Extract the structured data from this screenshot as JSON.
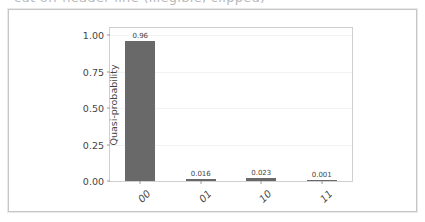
{
  "top_cropped_text": {
    "text": "cut off header line (illegible, clipped)"
  },
  "figure": {
    "alt": "quasi-probability bar chart"
  },
  "chart_data": {
    "type": "bar",
    "title": "",
    "xlabel": "",
    "ylabel": "Quasi-probability",
    "categories": [
      "00",
      "01",
      "10",
      "11"
    ],
    "values": [
      0.96,
      0.016,
      0.023,
      0.001
    ],
    "value_labels": [
      "0.96",
      "0.016",
      "0.023",
      "0.001"
    ],
    "ylim": [
      0.0,
      1.05
    ],
    "yticks": [
      0.0,
      0.25,
      0.5,
      0.75,
      1.0
    ],
    "ytick_labels": [
      "0.00",
      "0.25",
      "0.50",
      "0.75",
      "1.00"
    ],
    "grid": true,
    "grid_axis": "y",
    "legend": false,
    "legend_position": "none",
    "bar_color": "#696969",
    "xtick_rotation": -45
  }
}
